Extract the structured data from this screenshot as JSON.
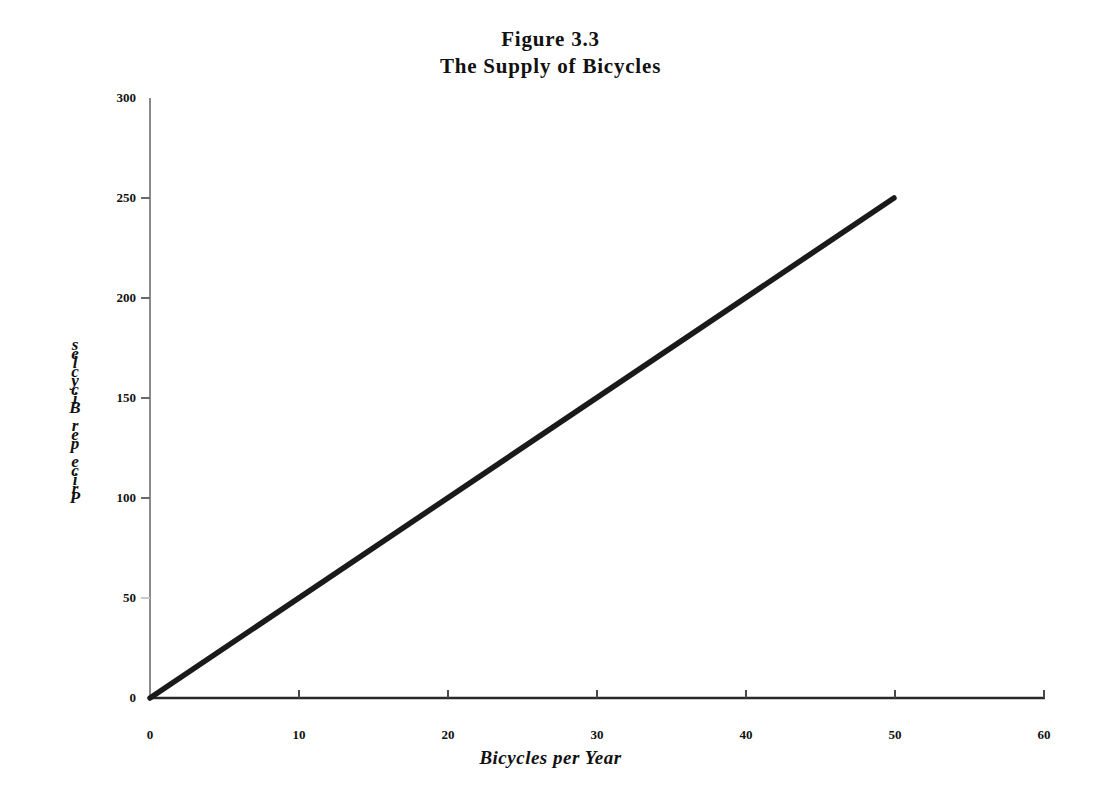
{
  "chart_data": {
    "type": "line",
    "title": "Figure 3.3",
    "subtitle": "The Supply of Bicycles",
    "xlabel": "Bicycles per Year",
    "ylabel": "Price per Bicycle",
    "xlim": [
      0,
      60
    ],
    "ylim": [
      0,
      300
    ],
    "xticks": [
      0,
      10,
      20,
      30,
      40,
      50,
      60
    ],
    "yticks": [
      0,
      50,
      100,
      150,
      200,
      250,
      300
    ],
    "xtick_labels": [
      "0",
      "10",
      "20",
      "30",
      "40",
      "50",
      "60"
    ],
    "ytick_labels": [
      "0",
      "50",
      "100",
      "150",
      "200",
      "250",
      "300"
    ],
    "grid": false,
    "legend": false,
    "series": [
      {
        "name": "Supply",
        "x": [
          0,
          50
        ],
        "values": [
          0,
          250
        ],
        "color": "#1a1a1a",
        "line_width": 5
      }
    ]
  },
  "title": {
    "line1": "Figure 3.3",
    "line2": "The Supply of Bicycles"
  },
  "axes": {
    "x_title": "Bicycles per Year",
    "y_title": "Price per Bicycle",
    "y_title_chars": [
      "s",
      "e",
      "l",
      "c",
      "y",
      "c",
      "i",
      "B",
      " ",
      "r",
      "e",
      "p",
      " ",
      "e",
      "c",
      "i",
      "r",
      "P"
    ],
    "axis_color_x": "#2a2a2a",
    "axis_color_y": "#8a8a8a",
    "tick_color": "#6a6a6a"
  },
  "colors": {
    "background": "#ffffff",
    "ink": "#1a1a1a",
    "supply_line": "#1a1a1a"
  }
}
